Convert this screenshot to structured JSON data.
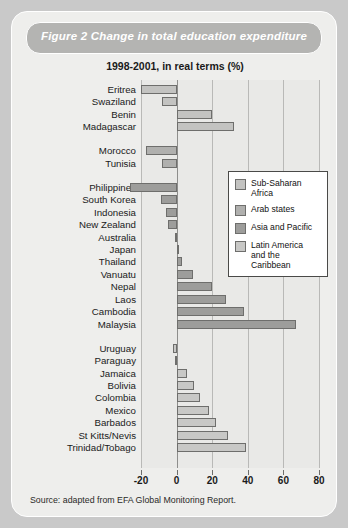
{
  "card": {
    "title": "Figure 2  Change in total education expenditure",
    "subtitle": "1998-2001, in real terms (%)",
    "source": "Source: adapted from EFA Global Monitoring Report."
  },
  "legend": {
    "items": [
      {
        "label": "Sub-Saharan Africa",
        "color": "#c3c3c1"
      },
      {
        "label": "Arab states",
        "color": "#b0b0ae"
      },
      {
        "label": "Asia and Pacific",
        "color": "#9d9d9b"
      },
      {
        "label": "Latin America\nand the Caribbean",
        "color": "#c8c8c6"
      }
    ]
  },
  "chart_data": {
    "type": "bar",
    "orientation": "horizontal",
    "title": "Figure 2  Change in total education expenditure",
    "subtitle": "1998-2001, in real terms (%)",
    "xlabel": "",
    "ylabel": "",
    "xlim": [
      -20,
      80
    ],
    "xticks": [
      -20,
      0,
      20,
      40,
      60,
      80
    ],
    "grid": true,
    "legend_position": "inside-right",
    "series": [
      {
        "name": "Sub-Saharan Africa",
        "color": "#c3c3c1",
        "categories": [
          "Eritrea",
          "Swaziland",
          "Benin",
          "Madagascar"
        ],
        "values": [
          -20,
          -8,
          20,
          32
        ]
      },
      {
        "name": "Arab states",
        "color": "#b0b0ae",
        "categories": [
          "Morocco",
          "Tunisia"
        ],
        "values": [
          -17,
          -8
        ]
      },
      {
        "name": "Asia and Pacific",
        "color": "#9d9d9b",
        "categories": [
          "Philippines",
          "South Korea",
          "Indonesia",
          "New Zealand",
          "Australia",
          "Japan",
          "Thailand",
          "Vanuatu",
          "Nepal",
          "Laos",
          "Cambodia",
          "Malaysia"
        ],
        "values": [
          -26,
          -9,
          -6,
          -5,
          -1,
          0,
          3,
          9,
          20,
          28,
          38,
          67
        ]
      },
      {
        "name": "Latin America and the Caribbean",
        "color": "#c8c8c6",
        "categories": [
          "Uruguay",
          "Paraguay",
          "Jamaica",
          "Bolivia",
          "Colombia",
          "Mexico",
          "Barbados",
          "St Kitts/Nevis",
          "Trinidad/Tobago"
        ],
        "values": [
          -2,
          -1,
          6,
          10,
          13,
          18,
          22,
          29,
          39
        ]
      }
    ]
  }
}
